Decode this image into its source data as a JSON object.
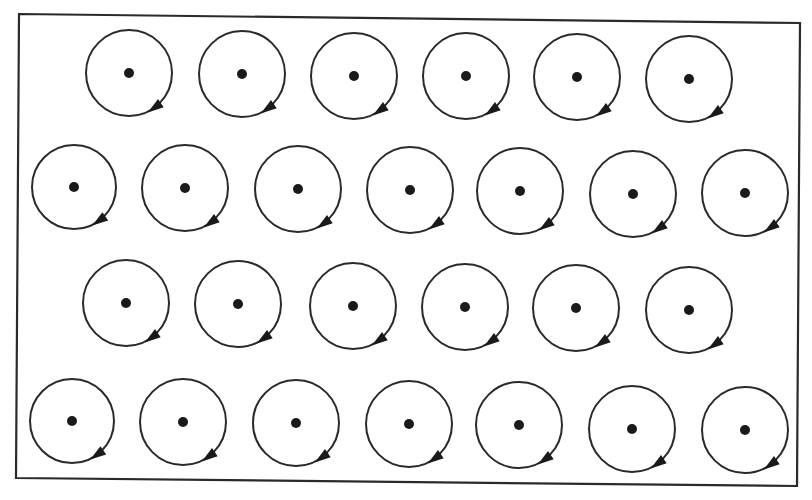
{
  "diagram": {
    "frame": {
      "points": [
        [
          19,
          14
        ],
        [
          800,
          23
        ],
        [
          797,
          486
        ],
        [
          16,
          478
        ]
      ],
      "stroke": "#2a2a2a",
      "stroke_width": 2.2
    },
    "style": {
      "circle_stroke": "#2a2a2a",
      "circle_stroke_width": 2,
      "dot_color": "#1a1a1a",
      "dot_radius": 5,
      "arrow_color": "#1a1a1a",
      "background": "#ffffff"
    },
    "rotation": "clockwise",
    "rows": [
      {
        "circles": [
          {
            "cx": 129,
            "cy": 73,
            "r": 43
          },
          {
            "cx": 242,
            "cy": 74,
            "r": 43
          },
          {
            "cx": 354,
            "cy": 76,
            "r": 43
          },
          {
            "cx": 466,
            "cy": 76,
            "r": 43
          },
          {
            "cx": 577,
            "cy": 77,
            "r": 43
          },
          {
            "cx": 689,
            "cy": 79,
            "r": 43
          }
        ]
      },
      {
        "circles": [
          {
            "cx": 74,
            "cy": 187,
            "r": 42
          },
          {
            "cx": 185,
            "cy": 188,
            "r": 43
          },
          {
            "cx": 298,
            "cy": 189,
            "r": 43
          },
          {
            "cx": 410,
            "cy": 190,
            "r": 43
          },
          {
            "cx": 520,
            "cy": 191,
            "r": 43
          },
          {
            "cx": 633,
            "cy": 194,
            "r": 43
          },
          {
            "cx": 745,
            "cy": 193,
            "r": 43
          }
        ]
      },
      {
        "circles": [
          {
            "cx": 126,
            "cy": 303,
            "r": 43
          },
          {
            "cx": 238,
            "cy": 304,
            "r": 43
          },
          {
            "cx": 353,
            "cy": 306,
            "r": 43
          },
          {
            "cx": 465,
            "cy": 307,
            "r": 43
          },
          {
            "cx": 576,
            "cy": 308,
            "r": 43
          },
          {
            "cx": 689,
            "cy": 310,
            "r": 43
          }
        ]
      },
      {
        "circles": [
          {
            "cx": 72,
            "cy": 421,
            "r": 42
          },
          {
            "cx": 183,
            "cy": 422,
            "r": 43
          },
          {
            "cx": 296,
            "cy": 423,
            "r": 43
          },
          {
            "cx": 409,
            "cy": 424,
            "r": 43
          },
          {
            "cx": 519,
            "cy": 425,
            "r": 43
          },
          {
            "cx": 632,
            "cy": 429,
            "r": 43
          },
          {
            "cx": 745,
            "cy": 430,
            "r": 43
          }
        ]
      }
    ]
  }
}
